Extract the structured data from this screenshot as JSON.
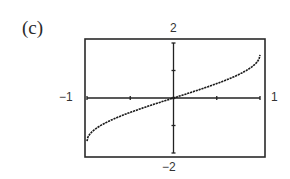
{
  "panel_label": "(c)",
  "chart_data": {
    "type": "line",
    "title": "",
    "function": "arcsin(x)",
    "xlabel": "",
    "ylabel": "",
    "xlim": [
      -1,
      1
    ],
    "ylim": [
      -2,
      2
    ],
    "x_tick_spacing": 0.5,
    "y_tick_spacing": 1,
    "window_labels": {
      "xmin": "−1",
      "xmax": "1",
      "ymin": "−2",
      "ymax": "2"
    },
    "grid": false,
    "legend": null,
    "series": [
      {
        "name": "y = arcsin x",
        "x": [
          -1,
          -0.9,
          -0.75,
          -0.5,
          -0.25,
          0,
          0.25,
          0.5,
          0.75,
          0.9,
          1
        ],
        "y": [
          -1.571,
          -1.12,
          -0.848,
          -0.524,
          -0.253,
          0,
          0.253,
          0.524,
          0.848,
          1.12,
          1.571
        ]
      }
    ]
  },
  "style": {
    "line_color": "#1a1a1a",
    "frame_color": "#2a2a2a"
  }
}
